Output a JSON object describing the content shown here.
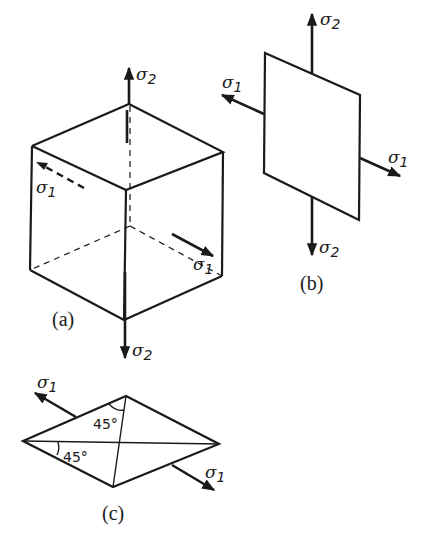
{
  "figure": {
    "panels": [
      {
        "id": "a",
        "label": "(a)",
        "description": "cube under principal stresses",
        "stresses": {
          "top": {
            "symbol": "σ",
            "sub": "2"
          },
          "bottom": {
            "symbol": "σ",
            "sub": "2"
          },
          "left": {
            "symbol": "σ",
            "sub": "1"
          },
          "right": {
            "symbol": "σ",
            "sub": "1"
          }
        }
      },
      {
        "id": "b",
        "label": "(b)",
        "description": "plane element under principal stresses",
        "stresses": {
          "top": {
            "symbol": "σ",
            "sub": "2"
          },
          "bottom": {
            "symbol": "σ",
            "sub": "2"
          },
          "left": {
            "symbol": "σ",
            "sub": "1"
          },
          "right": {
            "symbol": "σ",
            "sub": "1"
          }
        }
      },
      {
        "id": "c",
        "label": "(c)",
        "description": "rhombic element with 45° planes",
        "stresses": {
          "left": {
            "symbol": "σ",
            "sub": "1"
          },
          "right": {
            "symbol": "σ",
            "sub": "1"
          }
        },
        "angles": [
          "45°",
          "45°"
        ]
      }
    ]
  }
}
